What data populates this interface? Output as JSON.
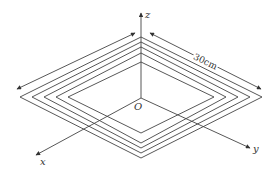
{
  "diagram": {
    "axes": {
      "x_label": "x",
      "y_label": "y",
      "z_label": "z",
      "origin_label": "O"
    },
    "dimension": {
      "label": "30cm"
    },
    "coil_count": 5,
    "colors": {
      "line": "#444444",
      "text": "#333333",
      "background": "#ffffff"
    }
  }
}
